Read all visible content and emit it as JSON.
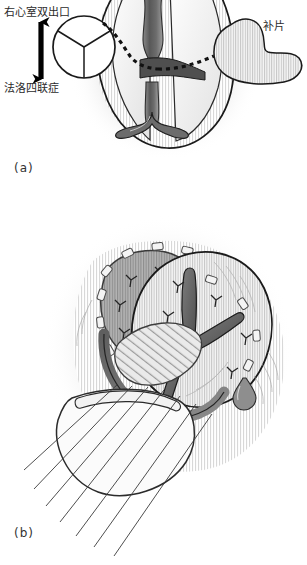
{
  "figure": {
    "style": "grayscale pen-and-ink medical illustration",
    "background_color": "#ffffff",
    "ink_color": "#1a1a1a"
  },
  "panels": [
    {
      "id": "a",
      "label": "(a)",
      "caption_position": "bottom-left",
      "description": "Ventricular view showing the septal defect, the great-artery valve orifice, the planned tunnel route (dashed) and the patch to be implanted."
    },
    {
      "id": "b",
      "label": "(b)",
      "caption_position": "bottom-left",
      "description": "The patch sutured in place with pledgeted interrupted stitches; trailing suture threads pass through a second patch below."
    }
  ],
  "annotations": [
    {
      "name": "double-outlet-right-ventricle",
      "text": "右心室双出口",
      "panel": "a",
      "position": "top-left",
      "points_to": "valve-orifice-circle"
    },
    {
      "name": "tetralogy-of-fallot",
      "text": "法洛四联症",
      "panel": "a",
      "position": "left",
      "points_to": "valve-orifice-circle"
    },
    {
      "name": "patch",
      "text": "补片",
      "panel": "a",
      "position": "top-right",
      "points_to": "patch-shape"
    }
  ],
  "markers": {
    "range_arrow": {
      "name": "double-headed-arrow",
      "orientation": "vertical",
      "meaning": "spectrum between double outlet right ventricle and tetralogy of Fallot",
      "color": "#000000"
    },
    "tunnel_route": {
      "name": "dashed-tunnel-line",
      "style": "dashed",
      "meaning": "planned intraventricular tunnel from valve orifice to patch"
    }
  },
  "colors": {
    "ink": "#1a1a1a",
    "tissue_light": "#f2f2f2",
    "tissue_mid": "#b9b9b9",
    "tissue_dark": "#6e6e6e",
    "muscle_shadow": "#8a8a8a",
    "hatch": "#cfcfcf",
    "patch_fill": "#fbfbfb",
    "suture": "#3a3a3a"
  }
}
